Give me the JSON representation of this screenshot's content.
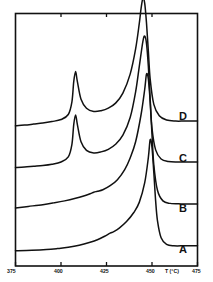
{
  "figure": {
    "kind": "dsc-thermogram",
    "background_color": "#ffffff",
    "line_color": "#111111"
  },
  "chart_data": {
    "type": "line",
    "title": "",
    "subtitle": "",
    "xlabel": "T (°C)",
    "ylabel": "",
    "xlim": [
      375,
      475
    ],
    "ylim": [
      0,
      1
    ],
    "grid": false,
    "legend_position": "inline-right",
    "xticks": [
      375,
      400,
      425,
      450,
      475
    ],
    "xtick_labels": [
      "375",
      "400",
      "425",
      "450",
      "475"
    ],
    "yticks": [],
    "ytick_labels": [],
    "annotations": [
      {
        "text": "D",
        "x": 466,
        "series": "D"
      },
      {
        "text": "C",
        "x": 466,
        "series": "C"
      },
      {
        "text": "B",
        "x": 466,
        "series": "B"
      },
      {
        "text": "A",
        "x": 466,
        "series": "A"
      }
    ],
    "series": [
      {
        "name": "D",
        "label": "D",
        "baseline_left": 0.555,
        "baseline_right": 0.575,
        "minor_peak_x": 408,
        "minor_peak_height": 0.215,
        "major_peak_x": 445,
        "major_peak_height": 0.735,
        "x": [
          375,
          380,
          385,
          390,
          395,
          400,
          404,
          406,
          407,
          408,
          409,
          411,
          414,
          418,
          422,
          426,
          430,
          434,
          438,
          441,
          443,
          444,
          445,
          446,
          447,
          448,
          449,
          451,
          454,
          458,
          463,
          468,
          475
        ],
        "y": [
          0.555,
          0.558,
          0.562,
          0.566,
          0.572,
          0.58,
          0.6,
          0.65,
          0.73,
          0.77,
          0.73,
          0.66,
          0.625,
          0.612,
          0.615,
          0.625,
          0.645,
          0.685,
          0.76,
          0.86,
          0.96,
          1.02,
          1.06,
          1.04,
          0.96,
          0.85,
          0.74,
          0.64,
          0.595,
          0.578,
          0.574,
          0.574,
          0.574
        ]
      },
      {
        "name": "C",
        "label": "C",
        "baseline_left": 0.39,
        "baseline_right": 0.415,
        "minor_peak_x": 408,
        "minor_peak_height": 0.2,
        "major_peak_x": 446,
        "major_peak_height": 0.62,
        "x": [
          375,
          380,
          385,
          390,
          395,
          400,
          404,
          406,
          407,
          408,
          409,
          411,
          414,
          418,
          422,
          426,
          430,
          434,
          438,
          441,
          443,
          445,
          446,
          447,
          448,
          449,
          450,
          452,
          455,
          459,
          464,
          470,
          475
        ],
        "y": [
          0.39,
          0.392,
          0.395,
          0.398,
          0.403,
          0.412,
          0.432,
          0.482,
          0.56,
          0.598,
          0.56,
          0.492,
          0.458,
          0.448,
          0.452,
          0.462,
          0.482,
          0.518,
          0.588,
          0.69,
          0.79,
          0.89,
          0.91,
          0.88,
          0.79,
          0.66,
          0.545,
          0.46,
          0.424,
          0.414,
          0.412,
          0.412,
          0.412
        ]
      },
      {
        "name": "B",
        "label": "B",
        "baseline_left": 0.23,
        "baseline_right": 0.25,
        "shoulder_x": 419,
        "major_peak_x": 447,
        "major_peak_height": 0.56,
        "x": [
          375,
          382,
          390,
          396,
          402,
          408,
          412,
          416,
          418,
          420,
          423,
          427,
          431,
          435,
          438,
          441,
          444,
          446,
          447,
          448,
          449,
          450,
          451,
          453,
          456,
          460,
          466,
          472,
          475
        ],
        "y": [
          0.23,
          0.236,
          0.243,
          0.25,
          0.258,
          0.268,
          0.276,
          0.286,
          0.292,
          0.296,
          0.302,
          0.318,
          0.342,
          0.382,
          0.428,
          0.492,
          0.6,
          0.7,
          0.76,
          0.74,
          0.65,
          0.52,
          0.4,
          0.3,
          0.258,
          0.248,
          0.246,
          0.246,
          0.246
        ]
      },
      {
        "name": "A",
        "label": "A",
        "baseline_left": 0.06,
        "baseline_right": 0.082,
        "shoulder_x": 428,
        "major_peak_x": 449,
        "major_peak_height": 0.44,
        "x": [
          375,
          384,
          392,
          398,
          404,
          410,
          416,
          420,
          424,
          427,
          429,
          432,
          436,
          440,
          443,
          446,
          448,
          449,
          450,
          451,
          452,
          453,
          455,
          458,
          462,
          468,
          475
        ],
        "y": [
          0.06,
          0.062,
          0.065,
          0.069,
          0.074,
          0.082,
          0.094,
          0.104,
          0.118,
          0.13,
          0.136,
          0.15,
          0.176,
          0.212,
          0.252,
          0.33,
          0.43,
          0.5,
          0.47,
          0.37,
          0.258,
          0.18,
          0.112,
          0.086,
          0.08,
          0.08,
          0.08
        ]
      }
    ]
  },
  "axis": {
    "x_title": "T (°C)",
    "tick_labels": [
      "375",
      "400",
      "425",
      "450",
      "475"
    ]
  },
  "labels": {
    "a": "A",
    "b": "B",
    "c": "C",
    "d": "D"
  }
}
